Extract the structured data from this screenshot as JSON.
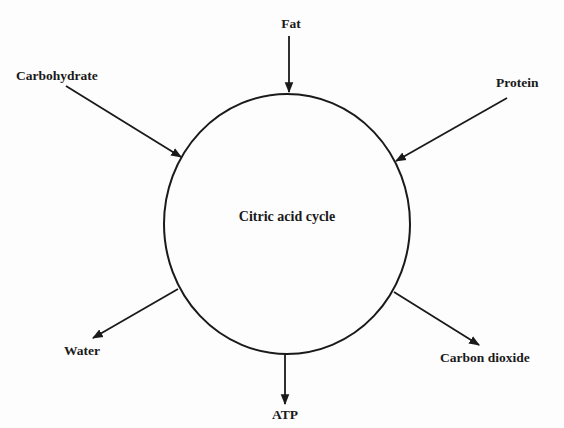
{
  "diagram": {
    "center_label": "Citric acid cycle",
    "inputs": [
      {
        "id": "fat",
        "label": "Fat"
      },
      {
        "id": "carbohydrate",
        "label": "Carbohydrate"
      },
      {
        "id": "protein",
        "label": "Protein"
      }
    ],
    "outputs": [
      {
        "id": "water",
        "label": "Water"
      },
      {
        "id": "atp",
        "label": "ATP"
      },
      {
        "id": "carbon-dioxide",
        "label": "Carbon dioxide"
      }
    ],
    "colors": {
      "ink": "#1a1a1a",
      "background": "#fdfdfd"
    }
  }
}
